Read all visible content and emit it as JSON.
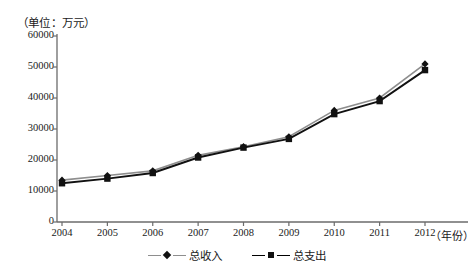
{
  "chart_data": {
    "type": "line",
    "title": "（单位：万元）",
    "xlabel": "（年份）",
    "ylabel": "",
    "categories": [
      "2004",
      "2005",
      "2006",
      "2007",
      "2008",
      "2009",
      "2010",
      "2011",
      "2012"
    ],
    "yticks": [
      "0",
      "10000",
      "20000",
      "30000",
      "40000",
      "50000",
      "60000"
    ],
    "ylim": [
      0,
      60000
    ],
    "grid": false,
    "legend_position": "bottom-center",
    "series": [
      {
        "name": "总收入",
        "marker": "diamond",
        "line_color": "#8e8e8e",
        "values": [
          13500,
          15000,
          16500,
          21500,
          24300,
          27500,
          36000,
          40000,
          51000
        ]
      },
      {
        "name": "总支出",
        "marker": "square",
        "line_color": "#111111",
        "values": [
          12500,
          14000,
          15800,
          20800,
          24000,
          26800,
          34800,
          39000,
          49000
        ]
      }
    ]
  },
  "legend": {
    "income_label": "总收入",
    "expense_label": "总支出"
  },
  "axis": {
    "unit_note": "（单位：万元）",
    "year_note": "（年份）"
  }
}
